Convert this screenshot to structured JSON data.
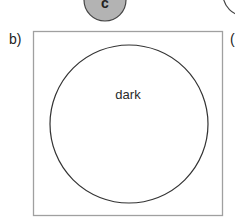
{
  "top_row": {
    "partial_circle_left": {
      "label": "c",
      "fill": "#b3b3b3",
      "stroke": "#444444"
    },
    "partial_circle_right": {
      "fill": "#ffffff",
      "stroke": "#444444"
    },
    "partial_label_right": "("
  },
  "panel_b": {
    "label": "b)",
    "box": {
      "stroke": "#a0a0a0",
      "fill": "#ffffff"
    },
    "circle": {
      "label": "dark",
      "stroke": "#333333",
      "fill": "#ffffff"
    }
  },
  "panel_c_partial": {
    "label": "("
  }
}
